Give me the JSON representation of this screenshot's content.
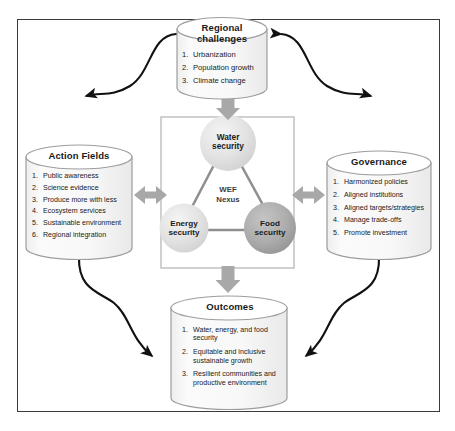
{
  "diagram": {
    "colors": {
      "frame_border": "#3a3a3a",
      "cylinder_stroke": "#9a9a9a",
      "cylinder_fill": "#f7f7f7",
      "cylinder_top_fill": "#ffffff",
      "block_arrow_fill": "#a6a6a6",
      "curve_arrow_stroke": "#111111",
      "center_box_stroke": "#b9b9b9",
      "circle_light": "#e3e3e3",
      "circle_dark": "#a9a9a9",
      "text": "#1a1a1a"
    },
    "nodes": {
      "regional_challenges": {
        "title": "Regional\nchallenges",
        "title_line1": "Regional",
        "title_line2": "challenges",
        "items": [
          {
            "num": "1.",
            "text": "Urbanization"
          },
          {
            "num": "2.",
            "text": "Population growth"
          },
          {
            "num": "3.",
            "text": "Climate change"
          }
        ]
      },
      "action_fields": {
        "title": "Action Fields",
        "items": [
          {
            "num": "1.",
            "text": "Public awareness"
          },
          {
            "num": "2.",
            "text": "Science evidence"
          },
          {
            "num": "3.",
            "text": "Produce more with less"
          },
          {
            "num": "4.",
            "text": "Ecosystem services"
          },
          {
            "num": "5.",
            "text": "Sustainable environment"
          },
          {
            "num": "6.",
            "text": "Regional integration"
          }
        ]
      },
      "governance": {
        "title": "Governance",
        "items": [
          {
            "num": "1.",
            "text": "Harmonized policies"
          },
          {
            "num": "2.",
            "text": "Aligned institutions"
          },
          {
            "num": "3.",
            "text": "Aligned targets/strategies"
          },
          {
            "num": "4.",
            "text": "Manage trade-offs"
          },
          {
            "num": "5.",
            "text": "Promote investment"
          }
        ]
      },
      "outcomes": {
        "title": "Outcomes",
        "items": [
          {
            "num": "1.",
            "text": "Water, energy, and food security"
          },
          {
            "num": "2.",
            "text": "Equitable and inclusive sustainable growth"
          },
          {
            "num": "3.",
            "text": "Resilient communities and productive environment"
          }
        ]
      }
    },
    "center": {
      "label_line1": "WEF",
      "label_line2": "Nexus",
      "circles": [
        {
          "id": "water",
          "line1": "Water",
          "line2": "security",
          "shade": "light"
        },
        {
          "id": "energy",
          "line1": "Energy",
          "line2": "security",
          "shade": "light"
        },
        {
          "id": "food",
          "line1": "Food",
          "line2": "security",
          "shade": "dark"
        }
      ]
    },
    "connectors": {
      "block_arrows": [
        {
          "id": "center-to-regional",
          "direction": "down",
          "position": "top"
        },
        {
          "id": "center-to-action-fields",
          "direction": "both",
          "position": "left"
        },
        {
          "id": "center-to-governance",
          "direction": "both",
          "position": "right"
        },
        {
          "id": "center-to-outcomes",
          "direction": "down",
          "position": "bottom"
        }
      ],
      "curved_arrows": [
        {
          "id": "regional-to-action-fields",
          "heads": "both"
        },
        {
          "id": "regional-to-governance",
          "heads": "both"
        },
        {
          "id": "action-fields-to-outcomes",
          "heads": "both"
        },
        {
          "id": "governance-to-outcomes",
          "heads": "both"
        }
      ]
    }
  }
}
